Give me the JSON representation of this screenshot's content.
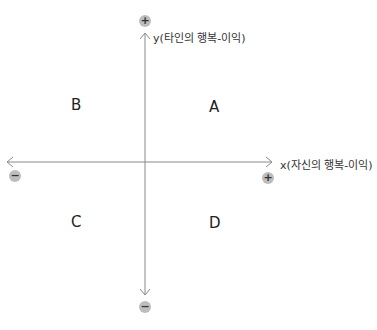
{
  "diagram": {
    "type": "quadrant",
    "x_axis": {
      "label": "x(자신의 행복-이익)",
      "positive_sign": "+",
      "negative_sign": "−"
    },
    "y_axis": {
      "label": "y(타인의 행복-이익)",
      "positive_sign": "+",
      "negative_sign": "−"
    },
    "quadrants": {
      "top_right": "A",
      "top_left": "B",
      "bottom_left": "C",
      "bottom_right": "D"
    },
    "colors": {
      "axis": "#888888",
      "sign_badge": "#bdbdbd",
      "text": "#222222"
    }
  }
}
